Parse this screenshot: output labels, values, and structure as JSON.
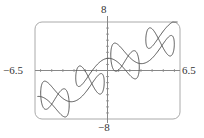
{
  "chart_data": {
    "type": "line",
    "subtype": "parametric",
    "title": "",
    "equations": {
      "x": "t + 2 sin(2t)",
      "y": "t + 2 cos(5t)"
    },
    "t_range": [
      -6.283,
      6.283
    ],
    "xlim": [
      -6.5,
      6.5
    ],
    "ylim": [
      -8,
      8
    ],
    "tick_labels": {
      "x_min": "−6.5",
      "x_max": "6.5",
      "y_max": "8",
      "y_min": "−8"
    },
    "xlabel": "",
    "ylabel": "",
    "grid": false,
    "legend": null,
    "frame": "rounded-rectangle",
    "colors": {
      "curve": "#555555",
      "axes": "#888888",
      "frame": "#aaaaaa"
    }
  }
}
